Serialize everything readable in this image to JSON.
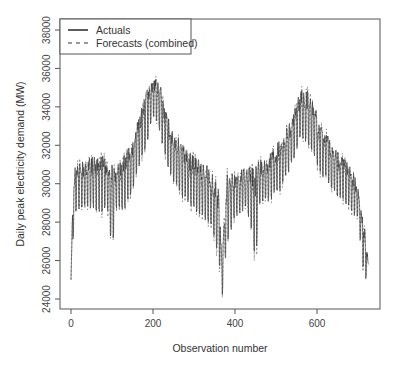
{
  "chart_data": {
    "type": "line",
    "title": "",
    "xlabel": "Observation number",
    "ylabel": "Daily peak electricity demand (MW)",
    "xlim": [
      -15,
      745
    ],
    "ylim": [
      23800,
      38500
    ],
    "x_ticks": [
      0,
      200,
      400,
      600
    ],
    "x_tick_labels": [
      "0",
      "200",
      "400",
      "600"
    ],
    "y_ticks": [
      24000,
      26000,
      28000,
      30000,
      32000,
      34000,
      36000,
      38000
    ],
    "y_tick_labels": [
      "24000",
      "26000",
      "28000",
      "30000",
      "32000",
      "34000",
      "36000",
      "38000"
    ],
    "grid": false,
    "legend_position": "top-left",
    "legend": [
      {
        "label": "Actuals",
        "style": "solid"
      },
      {
        "label": "Forecasts (combined)",
        "style": "dashed"
      }
    ],
    "series": [
      {
        "name": "Actuals",
        "style": "solid",
        "color": "#333333",
        "envelope_x": [
          0,
          5,
          10,
          30,
          60,
          90,
          100,
          110,
          130,
          150,
          170,
          190,
          200,
          215,
          230,
          250,
          280,
          310,
          340,
          360,
          368,
          380,
          400,
          430,
          450,
          460,
          480,
          510,
          540,
          560,
          580,
          610,
          640,
          680,
          700,
          715,
          725
        ],
        "envelope_high": [
          25000,
          29800,
          31000,
          31200,
          31500,
          31400,
          31300,
          30800,
          31600,
          32300,
          33800,
          35300,
          35300,
          35600,
          33800,
          32800,
          31800,
          31400,
          30800,
          29800,
          26200,
          30600,
          30500,
          30900,
          31000,
          31200,
          31400,
          32400,
          33500,
          34900,
          34800,
          33200,
          32000,
          31000,
          30000,
          28000,
          26000
        ],
        "envelope_low": [
          25000,
          27000,
          28500,
          28800,
          28600,
          28400,
          26500,
          28700,
          28500,
          29700,
          31000,
          32500,
          33500,
          32800,
          31300,
          30000,
          29000,
          28400,
          27800,
          26200,
          24000,
          26800,
          28200,
          28700,
          25800,
          28800,
          29000,
          29600,
          31000,
          32500,
          32000,
          30500,
          29500,
          28700,
          28000,
          25000,
          25200
        ]
      },
      {
        "name": "Forecasts (combined)",
        "style": "dashed",
        "color": "#777777",
        "note": "closely tracks actuals"
      }
    ]
  }
}
